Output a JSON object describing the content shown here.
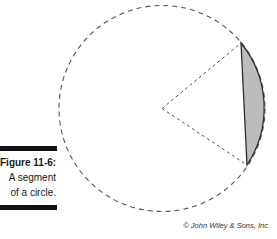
{
  "figure": {
    "label": "Figure 11-6:",
    "caption_lines": [
      "A segment",
      "of a circle."
    ],
    "credit": "© John Wiley & Sons, Inc."
  },
  "diagram": {
    "kind": "circle-segment",
    "circle": {
      "cx": 162,
      "cy": 108.5,
      "r": 103
    },
    "chord": {
      "top": {
        "x": 241,
        "y": 43
      },
      "bottom": {
        "x": 247,
        "y": 165
      }
    },
    "colors": {
      "segment_fill": "#bcbcbc",
      "segment_stroke": "#2e2e2e",
      "dashed_stroke": "#555555",
      "caption_bar": "#111111",
      "caption_text": "#1a1a1a",
      "credit_text": "#333333"
    },
    "dashes": {
      "circle": "5 4",
      "radius": "3 3"
    }
  }
}
